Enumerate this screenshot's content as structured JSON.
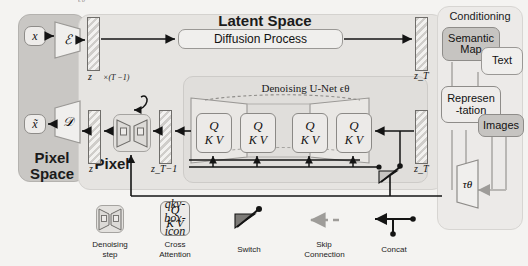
{
  "figure": {
    "kind": "latent-diffusion-architecture",
    "top_cut_text": "ϵθ"
  },
  "panels": {
    "pixel_space": {
      "title_line1": "Pixel",
      "title_line2": "Space"
    },
    "latent_space": {
      "title": "Latent Space",
      "diffusion_box": "Diffusion Process"
    },
    "conditioning": {
      "title": "Conditioning"
    },
    "unet": {
      "title": "Denoising U-Net ϵθ"
    }
  },
  "pixel_space_nodes": {
    "input": "x",
    "encoder": "ℰ",
    "decoder": "𝒟",
    "output": "x̃"
  },
  "latent_labels": {
    "z_top": "z",
    "zT_top": "z_T",
    "z_bottom": "z",
    "zT_minus_1": "z_T−1",
    "zT_bottom": "z_T",
    "loop_count": "×(T −1)"
  },
  "attention_blocks": [
    {
      "q": "Q",
      "kv": "K V"
    },
    {
      "q": "Q",
      "kv": "K V"
    },
    {
      "q": "Q",
      "kv": "K V"
    },
    {
      "q": "Q",
      "kv": "K V"
    }
  ],
  "conditioning_inputs": [
    {
      "id": "semantic-map",
      "label_line1": "Semantic",
      "label_line2": "Map",
      "shade": "dark"
    },
    {
      "id": "text",
      "label_line1": "Text",
      "label_line2": "",
      "shade": "light"
    },
    {
      "id": "representation",
      "label_line1": "Represen",
      "label_line2": "-tation",
      "shade": "mid"
    },
    {
      "id": "images",
      "label_line1": "Images",
      "label_line2": "",
      "shade": "mid"
    }
  ],
  "tau_encoder": {
    "label": "τθ"
  },
  "legend": [
    {
      "id": "denoising-step",
      "icon": "hourglass-denoise-icon",
      "line1": "Denoising",
      "line2": "step"
    },
    {
      "id": "cross-attention",
      "icon": "qkv-box-icon",
      "line1": "Cross",
      "line2": "Attention"
    },
    {
      "id": "switch",
      "icon": "switch-icon",
      "line1": "Switch",
      "line2": ""
    },
    {
      "id": "skip-connection",
      "icon": "dashed-arrow-icon",
      "line1": "Skip",
      "line2": "Connection"
    },
    {
      "id": "concat",
      "icon": "concat-arrow-icon",
      "line1": "Concat",
      "line2": ""
    }
  ],
  "colors": {
    "background": "#f4f3f1",
    "pixel_panel": "#c9c7c4",
    "latent_panel": "#e6e4e1",
    "conditioning_panel": "#eceae8",
    "unet_panel": "#e0dedb",
    "stroke": "#141414",
    "skip_gray": "#9e9c99"
  }
}
